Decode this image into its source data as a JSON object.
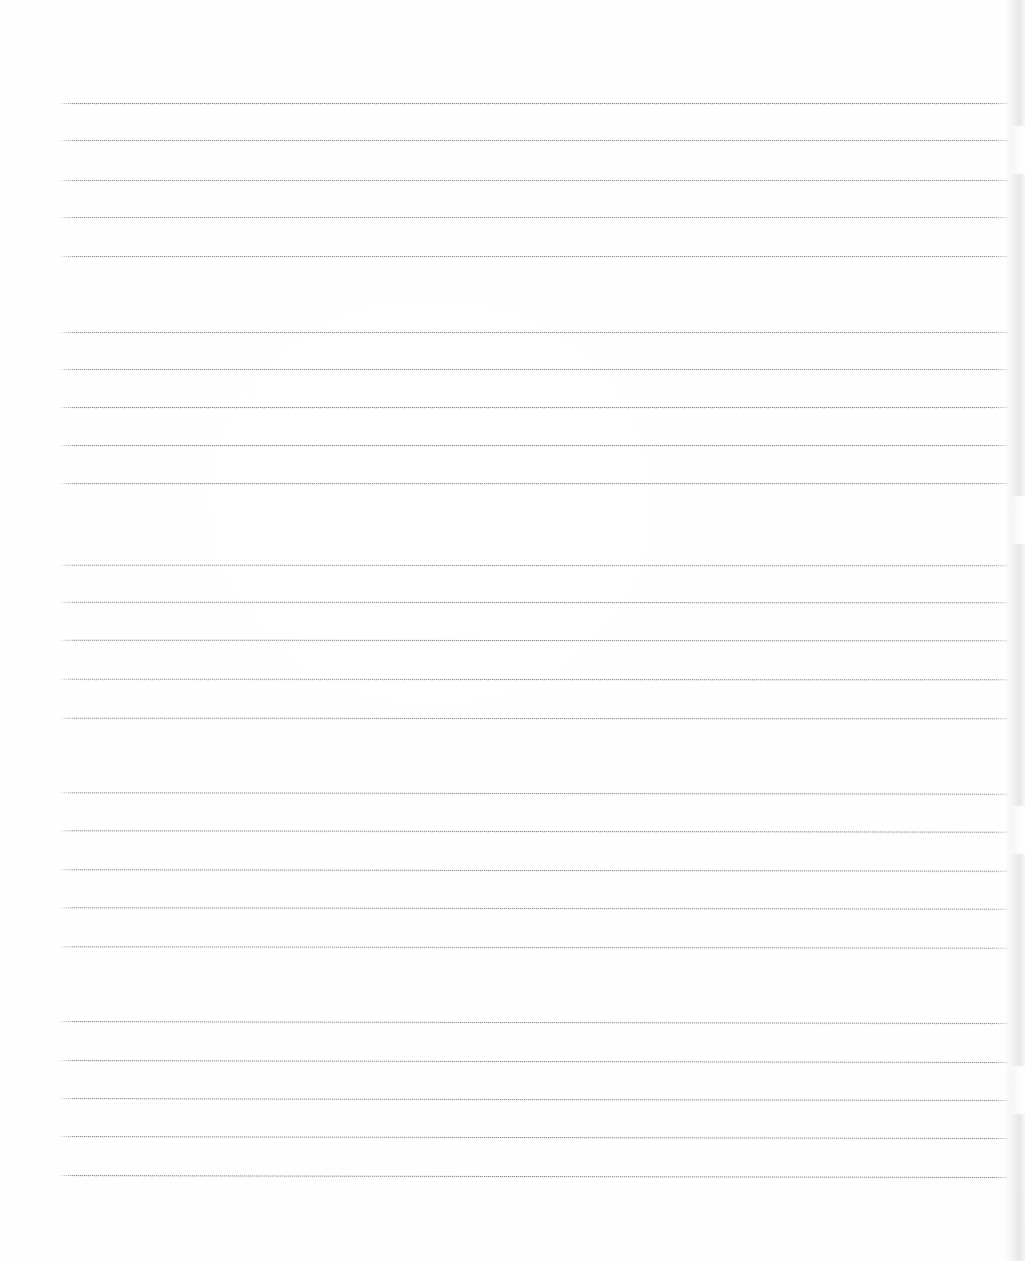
{
  "document": {
    "kind": "scanned-lined-paper",
    "title": "Blank lined notebook page (scan)",
    "page_width": 1025,
    "page_height": 1261,
    "background_color": "#ffffff",
    "rule_color": "#8a8a8a",
    "rule_color_light": "#c4c4c4",
    "scan_edge_shadow_color": "#bcbcbc",
    "text_content": "",
    "handwriting_present": "none",
    "visible_labels": [],
    "rule_geometry": {
      "left_x": 60,
      "right_x": 1008,
      "line_width": 948,
      "within_group_spacing": 38,
      "between_group_spacing": 75,
      "total_rules": 25,
      "groups": 5
    },
    "rule_groups": [
      {
        "index": 1,
        "name": "rule-group-1",
        "rules": [
          {
            "id": "rule-1",
            "y": 103,
            "tilt": 0,
            "opacity": 0.92
          },
          {
            "id": "rule-2",
            "y": 140,
            "tilt": 0,
            "opacity": 0.9
          },
          {
            "id": "rule-3",
            "y": 180,
            "tilt": 0,
            "opacity": 0.88
          },
          {
            "id": "rule-4",
            "y": 217,
            "tilt": 0,
            "opacity": 0.86
          },
          {
            "id": "rule-5",
            "y": 256,
            "tilt": 0,
            "opacity": 0.88
          }
        ]
      },
      {
        "index": 2,
        "name": "rule-group-2",
        "rules": [
          {
            "id": "rule-6",
            "y": 332,
            "tilt": 0,
            "opacity": 0.9
          },
          {
            "id": "rule-7",
            "y": 369,
            "tilt": 0,
            "opacity": 0.88
          },
          {
            "id": "rule-8",
            "y": 407,
            "tilt": 0,
            "opacity": 0.92
          },
          {
            "id": "rule-9",
            "y": 445,
            "tilt": 0,
            "opacity": 0.9
          },
          {
            "id": "rule-10",
            "y": 483,
            "tilt": 0,
            "opacity": 0.88
          }
        ]
      },
      {
        "index": 3,
        "name": "rule-group-3",
        "rules": [
          {
            "id": "rule-11",
            "y": 565,
            "tilt": 1,
            "opacity": 0.86
          },
          {
            "id": "rule-12",
            "y": 602,
            "tilt": 1,
            "opacity": 0.9
          },
          {
            "id": "rule-13",
            "y": 640,
            "tilt": 1,
            "opacity": 0.92
          },
          {
            "id": "rule-14",
            "y": 679,
            "tilt": 1,
            "opacity": 0.9
          },
          {
            "id": "rule-15",
            "y": 718,
            "tilt": 1,
            "opacity": 0.92
          }
        ]
      },
      {
        "index": 4,
        "name": "rule-group-4",
        "rules": [
          {
            "id": "rule-16",
            "y": 793,
            "tilt": 2,
            "opacity": 0.88
          },
          {
            "id": "rule-17",
            "y": 831,
            "tilt": 2,
            "opacity": 0.92
          },
          {
            "id": "rule-18",
            "y": 870,
            "tilt": 2,
            "opacity": 0.94
          },
          {
            "id": "rule-19",
            "y": 908,
            "tilt": 2,
            "opacity": 0.9
          },
          {
            "id": "rule-20",
            "y": 947,
            "tilt": 2,
            "opacity": 0.88
          }
        ]
      },
      {
        "index": 5,
        "name": "rule-group-5",
        "rules": [
          {
            "id": "rule-21",
            "y": 1022,
            "tilt": 3,
            "opacity": 0.92
          },
          {
            "id": "rule-22",
            "y": 1061,
            "tilt": 3,
            "opacity": 0.94
          },
          {
            "id": "rule-23",
            "y": 1099,
            "tilt": 3,
            "opacity": 0.92
          },
          {
            "id": "rule-24",
            "y": 1137,
            "tilt": 3,
            "opacity": 0.94
          },
          {
            "id": "rule-25",
            "y": 1176,
            "tilt": 3,
            "opacity": 0.96
          }
        ]
      }
    ],
    "scan_artifacts": {
      "right_edge_shadow": true,
      "edge_notches_y": [
        150,
        520,
        830,
        1090
      ],
      "top_margin_blank_px": 103,
      "bottom_margin_blank_px": 85
    }
  }
}
